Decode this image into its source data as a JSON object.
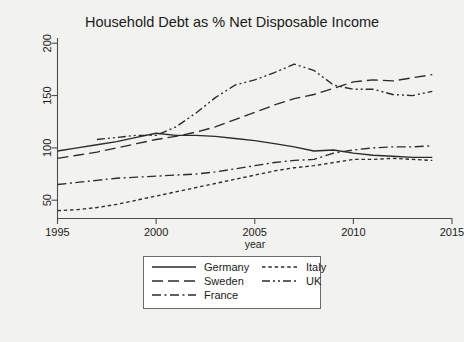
{
  "chart_data": {
    "type": "line",
    "title": "Household Debt as % Net Disposable Income",
    "xlabel": "year",
    "ylabel": "",
    "xlim": [
      1995,
      2015
    ],
    "ylim": [
      33,
      205
    ],
    "xticks": [
      1995,
      2000,
      2005,
      2010,
      2015
    ],
    "yticks": [
      50,
      100,
      150,
      200
    ],
    "grid": false,
    "legend_position": "bottom-center",
    "series": [
      {
        "name": "Germany",
        "dash": "solid",
        "x": [
          1995,
          1996,
          1997,
          1998,
          1999,
          2000,
          2001,
          2002,
          2003,
          2004,
          2005,
          2006,
          2007,
          2008,
          2009,
          2010,
          2011,
          2012,
          2013,
          2014
        ],
        "values": [
          97,
          100,
          103,
          106,
          110,
          114,
          112,
          112,
          111,
          109,
          107,
          104,
          101,
          97,
          98,
          95,
          93,
          92,
          91,
          91
        ]
      },
      {
        "name": "Sweden",
        "dash": "long-dash",
        "x": [
          1995,
          1996,
          1997,
          1998,
          1999,
          2000,
          2001,
          2002,
          2003,
          2004,
          2005,
          2006,
          2007,
          2008,
          2009,
          2010,
          2011,
          2012,
          2013,
          2014
        ],
        "values": [
          90,
          93,
          96,
          100,
          104,
          108,
          111,
          115,
          120,
          127,
          134,
          141,
          147,
          151,
          157,
          163,
          165,
          164,
          167,
          170
        ]
      },
      {
        "name": "France",
        "dash": "dash-dot",
        "x": [
          1995,
          1996,
          1997,
          1998,
          1999,
          2000,
          2001,
          2002,
          2003,
          2004,
          2005,
          2006,
          2007,
          2008,
          2009,
          2010,
          2011,
          2012,
          2013,
          2014
        ],
        "values": [
          65,
          67,
          69,
          71,
          72,
          73,
          74,
          75,
          77,
          80,
          83,
          86,
          88,
          89,
          95,
          98,
          100,
          101,
          101,
          102
        ]
      },
      {
        "name": "Italy",
        "dash": "dotted",
        "x": [
          1995,
          1996,
          1997,
          1998,
          1999,
          2000,
          2001,
          2002,
          2003,
          2004,
          2005,
          2006,
          2007,
          2008,
          2009,
          2010,
          2011,
          2012,
          2013,
          2014
        ],
        "values": [
          40,
          41,
          43,
          46,
          50,
          54,
          58,
          62,
          66,
          70,
          74,
          78,
          81,
          83,
          86,
          89,
          89,
          90,
          89,
          88
        ]
      },
      {
        "name": "UK",
        "dash": "dash-dot-dot",
        "x": [
          1997,
          1998,
          1999,
          2000,
          2001,
          2002,
          2003,
          2004,
          2005,
          2006,
          2007,
          2008,
          2009,
          2010,
          2011,
          2012,
          2013,
          2014
        ],
        "values": [
          108,
          110,
          112,
          112,
          120,
          133,
          148,
          160,
          165,
          172,
          180,
          174,
          160,
          156,
          156,
          151,
          150,
          154
        ]
      }
    ]
  },
  "legend": {
    "items": [
      {
        "label": "Germany",
        "dash": "solid"
      },
      {
        "label": "Sweden",
        "dash": "long-dash"
      },
      {
        "label": "France",
        "dash": "dash-dot"
      },
      {
        "label": "Italy",
        "dash": "dotted"
      },
      {
        "label": "UK",
        "dash": "dash-dot-dot"
      }
    ]
  }
}
